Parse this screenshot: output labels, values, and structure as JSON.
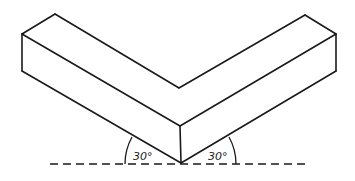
{
  "diagram": {
    "title": "",
    "colors": {
      "line": "#1a1a1a",
      "background": "#ffffff"
    },
    "angles": [
      {
        "id": "left",
        "label": "30°",
        "value_deg": 30
      },
      {
        "id": "right",
        "label": "30°",
        "value_deg": 30
      }
    ],
    "baseline": {
      "style": "dashed"
    }
  }
}
